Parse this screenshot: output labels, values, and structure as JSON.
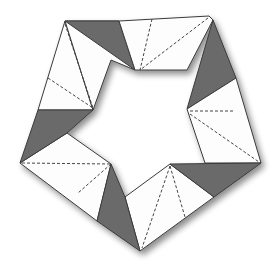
{
  "diagram": {
    "title": "Origami pentagon ring (five-module assembly)",
    "type": "origami-crease-diagram",
    "modules_count": 5,
    "colors": {
      "paper_white": "#fdfdfd",
      "paper_colored": "#6b6b6b",
      "outline": "#3a3a3a",
      "shadow": "#bdbdbd",
      "background": "#ffffff"
    },
    "legend": {
      "dashed_line": "crease / hidden edge",
      "gray_fill": "colored side of paper",
      "white_fill": "white side of paper"
    },
    "outer_vertices": [
      [
        65,
        21
      ],
      [
        209,
        16
      ],
      [
        261,
        163
      ],
      [
        140,
        251
      ],
      [
        20,
        163
      ]
    ],
    "inner_star_points": [
      [
        135,
        70
      ],
      [
        188,
        110
      ],
      [
        170,
        164
      ],
      [
        111,
        164
      ],
      [
        93,
        110
      ]
    ]
  }
}
